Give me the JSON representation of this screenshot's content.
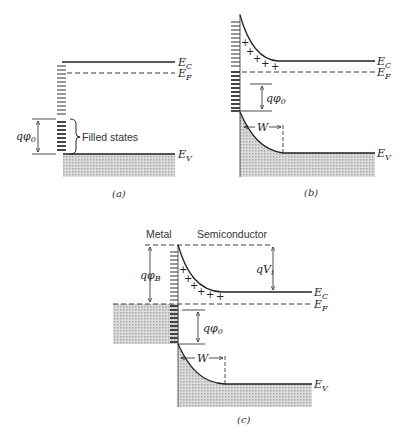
{
  "figure": {
    "panels": [
      {
        "id": "a",
        "caption": "(a)",
        "labels": {
          "conduction_band": "E",
          "conduction_band_sub": "C",
          "fermi_level": "E",
          "fermi_level_sub": "F",
          "valence_band": "E",
          "valence_band_sub": "V",
          "surface_potential": "qφ",
          "surface_potential_sub": "0",
          "filled_states": "Filled states"
        }
      },
      {
        "id": "b",
        "caption": "(b)",
        "labels": {
          "conduction_band": "E",
          "conduction_band_sub": "C",
          "fermi_level": "E",
          "fermi_level_sub": "F",
          "valence_band": "E",
          "valence_band_sub": "V",
          "surface_potential": "qφ",
          "surface_potential_sub": "0",
          "depletion_width": "W",
          "charges": "+ + + + +"
        }
      },
      {
        "id": "c",
        "caption": "(c)",
        "labels": {
          "metal": "Metal",
          "semiconductor": "Semiconductor",
          "barrier_height": "qφ",
          "barrier_height_sub": "B",
          "built_in_potential": "qV",
          "built_in_potential_sub": "i",
          "conduction_band": "E",
          "conduction_band_sub": "C",
          "fermi_level": "E",
          "fermi_level_sub": "F",
          "valence_band": "E",
          "valence_band_sub": "V",
          "surface_potential": "qφ",
          "surface_potential_sub": "0",
          "depletion_width": "W",
          "charges": "+ + + + + +"
        }
      }
    ],
    "colors": {
      "line": "#222222",
      "shade": "#c8c8c8",
      "background": "#ffffff"
    }
  }
}
